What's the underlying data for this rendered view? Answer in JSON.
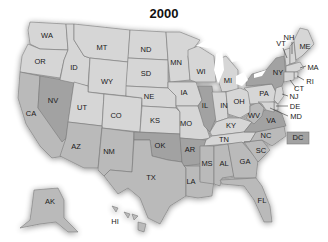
{
  "title": "2000",
  "colors": {
    "light": "#d6d6d6",
    "medium": "#bababa",
    "dark": "#a2a2a2",
    "water": "#ffffff",
    "border": "#7a7a7a"
  },
  "states": {
    "WA": {
      "label": "WA",
      "tier": "light"
    },
    "OR": {
      "label": "OR",
      "tier": "light"
    },
    "CA": {
      "label": "CA",
      "tier": "medium"
    },
    "NV": {
      "label": "NV",
      "tier": "dark"
    },
    "ID": {
      "label": "ID",
      "tier": "light"
    },
    "MT": {
      "label": "MT",
      "tier": "light"
    },
    "WY": {
      "label": "WY",
      "tier": "light"
    },
    "UT": {
      "label": "UT",
      "tier": "light"
    },
    "CO": {
      "label": "CO",
      "tier": "light"
    },
    "AZ": {
      "label": "AZ",
      "tier": "medium"
    },
    "NM": {
      "label": "NM",
      "tier": "medium"
    },
    "ND": {
      "label": "ND",
      "tier": "light"
    },
    "SD": {
      "label": "SD",
      "tier": "light"
    },
    "NE": {
      "label": "NE",
      "tier": "light"
    },
    "KS": {
      "label": "KS",
      "tier": "light"
    },
    "OK": {
      "label": "OK",
      "tier": "dark"
    },
    "TX": {
      "label": "TX",
      "tier": "medium"
    },
    "MN": {
      "label": "MN",
      "tier": "light"
    },
    "IA": {
      "label": "IA",
      "tier": "light"
    },
    "MO": {
      "label": "MO",
      "tier": "light"
    },
    "AR": {
      "label": "AR",
      "tier": "dark"
    },
    "LA": {
      "label": "LA",
      "tier": "medium"
    },
    "WI": {
      "label": "WI",
      "tier": "light"
    },
    "IL": {
      "label": "IL",
      "tier": "dark"
    },
    "MI": {
      "label": "MI",
      "tier": "light"
    },
    "IN": {
      "label": "IN",
      "tier": "light"
    },
    "OH": {
      "label": "OH",
      "tier": "light"
    },
    "KY": {
      "label": "KY",
      "tier": "light"
    },
    "TN": {
      "label": "TN",
      "tier": "light"
    },
    "MS": {
      "label": "MS",
      "tier": "medium"
    },
    "AL": {
      "label": "AL",
      "tier": "medium"
    },
    "GA": {
      "label": "GA",
      "tier": "medium"
    },
    "FL": {
      "label": "FL",
      "tier": "medium"
    },
    "SC": {
      "label": "SC",
      "tier": "medium"
    },
    "NC": {
      "label": "NC",
      "tier": "medium"
    },
    "VA": {
      "label": "VA",
      "tier": "dark"
    },
    "WV": {
      "label": "WV",
      "tier": "medium"
    },
    "PA": {
      "label": "PA",
      "tier": "light"
    },
    "NY": {
      "label": "NY",
      "tier": "dark"
    },
    "VT": {
      "label": "VT",
      "tier": "light"
    },
    "NH": {
      "label": "NH",
      "tier": "light"
    },
    "ME": {
      "label": "ME",
      "tier": "light"
    },
    "MA": {
      "label": "MA",
      "tier": "light"
    },
    "RI": {
      "label": "RI",
      "tier": "light"
    },
    "CT": {
      "label": "CT",
      "tier": "light"
    },
    "NJ": {
      "label": "NJ",
      "tier": "light"
    },
    "DE": {
      "label": "DE",
      "tier": "light"
    },
    "MD": {
      "label": "MD",
      "tier": "light"
    },
    "DC": {
      "label": "DC",
      "tier": "dark"
    },
    "AK": {
      "label": "AK",
      "tier": "medium"
    },
    "HI": {
      "label": "HI",
      "tier": "medium"
    }
  }
}
